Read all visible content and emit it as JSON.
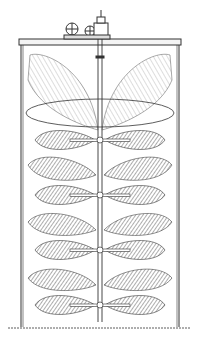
{
  "figure": {
    "vessel": {
      "left": 20,
      "right": 180,
      "top": 38,
      "bottom": 328
    },
    "shaft_x": 100,
    "impellers": [
      {
        "y": 140
      },
      {
        "y": 195
      },
      {
        "y": 250
      },
      {
        "y": 305
      }
    ],
    "ink_color": "#222222",
    "background_color": "#ffffff"
  }
}
